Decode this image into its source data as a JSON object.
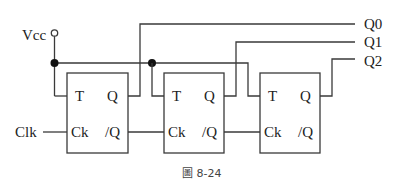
{
  "diagram": {
    "type": "circuit",
    "caption": "圖 8-24",
    "supply_label": "Vcc",
    "clock_label": "Clk",
    "outputs": [
      "Q0",
      "Q1",
      "Q2"
    ],
    "flip_flops": [
      {
        "t_pin": "T",
        "q_pin": "Q",
        "ck_pin": "Ck",
        "qbar_pin": "/Q"
      },
      {
        "t_pin": "T",
        "q_pin": "Q",
        "ck_pin": "Ck",
        "qbar_pin": "/Q"
      },
      {
        "t_pin": "T",
        "q_pin": "Q",
        "ck_pin": "Ck",
        "qbar_pin": "/Q"
      }
    ],
    "colors": {
      "line": "#3a3a3a",
      "text": "#222222",
      "caption": "#444444"
    }
  }
}
